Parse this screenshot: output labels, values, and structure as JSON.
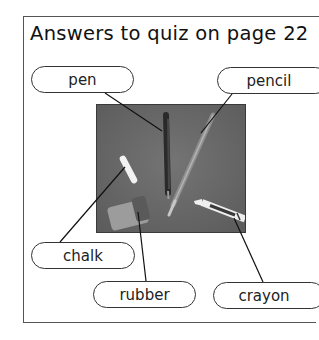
{
  "title": "Answers to quiz on page 22",
  "labels": {
    "pen": "pen",
    "pencil": "pencil",
    "chalk": "chalk",
    "rubber": "rubber",
    "crayon": "crayon"
  },
  "photo": {
    "description": "photo of stationery items on grey background",
    "items": [
      "pen",
      "pencil",
      "chalk",
      "rubber",
      "crayon"
    ],
    "background_color": "#6a6a6a"
  },
  "colors": {
    "frame": "#555555",
    "pill_border": "#333333",
    "text": "#1a1a1a"
  }
}
